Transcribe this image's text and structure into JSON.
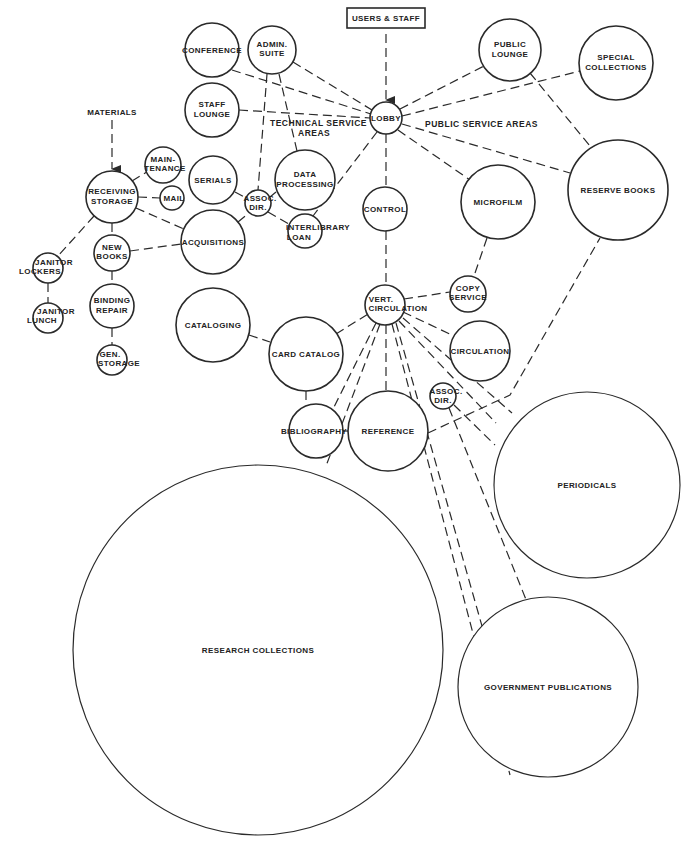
{
  "diagram": {
    "inputs": {
      "users_staff": "USERS & STAFF",
      "materials": "MATERIALS"
    },
    "area_labels": {
      "technical_1": "TECHNICAL SERVICE",
      "technical_2": "AREAS",
      "public": "PUBLIC SERVICE AREAS"
    },
    "nodes": {
      "conference": [
        "CONFERENCE"
      ],
      "admin_suite": [
        "ADMIN.",
        "SUITE"
      ],
      "staff_lounge": [
        "STAFF",
        "LOUNGE"
      ],
      "lobby": [
        "LOBBY"
      ],
      "public_lounge": [
        "PUBLIC",
        "LOUNGE"
      ],
      "special_collections": [
        "SPECIAL",
        "COLLECTIONS"
      ],
      "receiving_storage": [
        "RECEIVING",
        "STORAGE"
      ],
      "maintenance": [
        "MAIN-",
        "TENANCE"
      ],
      "mail": [
        "MAIL"
      ],
      "serials": [
        "SERIALS"
      ],
      "assoc_dir_tech": [
        "ASSOC.",
        "DIR."
      ],
      "data_processing": [
        "DATA",
        "PROCESSING"
      ],
      "acquisitions": [
        "ACQUISITIONS"
      ],
      "interlibrary_loan": [
        "INTERLIBRARY",
        "LOAN"
      ],
      "control": [
        "CONTROL"
      ],
      "microfilm": [
        "MICROFILM"
      ],
      "reserve_books": [
        "RESERVE BOOKS"
      ],
      "new_books": [
        "NEW",
        "BOOKS"
      ],
      "janitor_lockers": [
        "JANITOR",
        "LOCKERS"
      ],
      "janitor_lunch": [
        "JANITOR",
        "LUNCH"
      ],
      "binding_repair": [
        "BINDING",
        "REPAIR"
      ],
      "gen_storage": [
        "GEN.",
        "STORAGE"
      ],
      "copy_service": [
        "COPY",
        "SERVICE"
      ],
      "vert_circulation": [
        "VERT.",
        "CIRCULATION"
      ],
      "cataloging": [
        "CATALOGING"
      ],
      "card_catalog": [
        "CARD CATALOG"
      ],
      "circulation": [
        "CIRCULATION"
      ],
      "assoc_dir_public": [
        "ASSOC.",
        "DIR."
      ],
      "bibliography": [
        "BIBLIOGRAPHY"
      ],
      "reference": [
        "REFERENCE"
      ],
      "periodicals": [
        "PERIODICALS"
      ],
      "research_collections": [
        "RESEARCH COLLECTIONS"
      ],
      "government_publications": [
        "GOVERNMENT PUBLICATIONS"
      ]
    }
  }
}
